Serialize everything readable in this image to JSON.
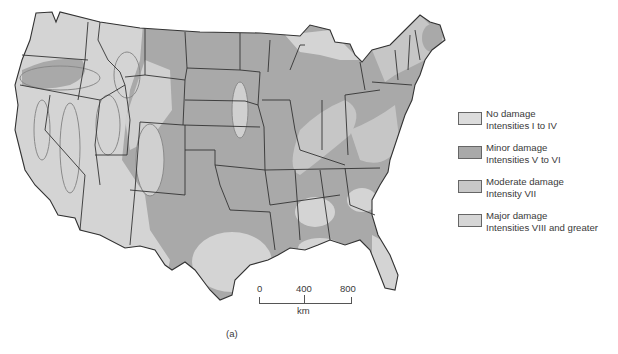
{
  "map": {
    "title": "Seismic risk map of the contiguous United States",
    "colors": {
      "none": "#d9d9d9",
      "minor": "#a9a9a9",
      "moderate": "#c6c6c6",
      "major": "#d3d3d3",
      "border": "#333333",
      "zone_outline": "#8a8a8a"
    }
  },
  "legend": {
    "items": [
      {
        "label": "No damage",
        "sub": "Intensities I to IV",
        "color": "#dcdcdc"
      },
      {
        "label": "Minor damage",
        "sub": "Intensities V to VI",
        "color": "#a9a9a9"
      },
      {
        "label": "Moderate damage",
        "sub": "Intensity VII",
        "color": "#c8c8c8"
      },
      {
        "label": "Major damage",
        "sub": "Intensities VIII and greater",
        "color": "#d6d6d6"
      }
    ]
  },
  "scale": {
    "ticks": [
      "0",
      "400",
      "800"
    ],
    "unit": "km"
  },
  "caption": "(a)"
}
